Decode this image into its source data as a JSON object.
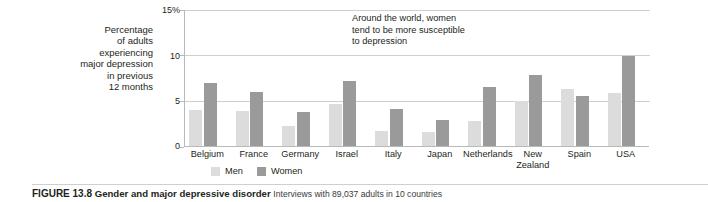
{
  "figure": {
    "caption_number": "FIGURE 13.8",
    "caption_title": "Gender and major depressive disorder",
    "caption_text": "Interviews with 89,037 adults in 10 countries"
  },
  "axis": {
    "y_label_lines": [
      "Percentage",
      "of adults",
      "experiencing",
      "major depression",
      "in previous",
      "12 months"
    ],
    "y_ticks": [
      "15%",
      "10",
      "5",
      "0"
    ]
  },
  "annotation": {
    "lines": [
      "Around the world, women",
      "tend to be more susceptible",
      "to depression"
    ]
  },
  "legend": {
    "items": [
      {
        "label": "Men",
        "color": "#dcdcdc"
      },
      {
        "label": "Women",
        "color": "#9a9a9a"
      }
    ]
  },
  "chart_data": {
    "type": "bar",
    "title": "Gender and major depressive disorder",
    "xlabel": "",
    "ylabel": "Percentage of adults experiencing major depression in previous 12 months",
    "ylim": [
      0,
      15
    ],
    "yticks": [
      0,
      5,
      10,
      15
    ],
    "grid": true,
    "legend_position": "bottom",
    "categories": [
      "Belgium",
      "France",
      "Germany",
      "Israel",
      "Italy",
      "Japan",
      "Netherlands",
      "New Zealand",
      "Spain",
      "USA"
    ],
    "series": [
      {
        "name": "Men",
        "color": "#dcdcdc",
        "values": [
          4.0,
          3.9,
          2.2,
          4.6,
          1.7,
          1.5,
          2.8,
          5.0,
          6.3,
          5.9
        ]
      },
      {
        "name": "Women",
        "color": "#9a9a9a",
        "values": [
          6.9,
          6.0,
          3.7,
          7.2,
          4.1,
          2.9,
          6.5,
          7.8,
          5.5,
          9.9
        ]
      }
    ]
  }
}
